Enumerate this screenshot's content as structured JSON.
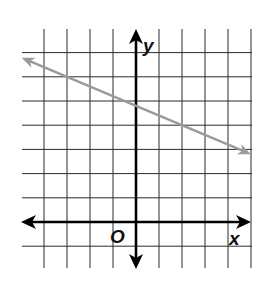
{
  "chart_data": {
    "type": "line",
    "title": "",
    "xlabel": "x",
    "ylabel": "y",
    "origin_label": "O",
    "grid": true,
    "xlim": [
      -5,
      5
    ],
    "ylim": [
      -2,
      8
    ],
    "axis_ticks_labeled": false,
    "series": [
      {
        "name": "line",
        "equation": "y = -0.4x + 4.8",
        "slope": -0.4,
        "intercept": 4.8,
        "arrows_both_ends": true,
        "color": "#9a9a9a",
        "x": [
          -5,
          -3,
          0,
          2,
          5
        ],
        "y": [
          6.8,
          6.0,
          4.8,
          4.0,
          2.8
        ]
      }
    ]
  },
  "labels": {
    "x_axis": "x",
    "y_axis": "y",
    "origin": "O"
  },
  "colors": {
    "grid": "#2a2a2a",
    "axes": "#000000",
    "line": "#9a9a9a"
  }
}
